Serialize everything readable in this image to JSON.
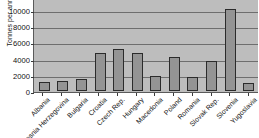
{
  "chart_data": {
    "type": "bar",
    "title": "",
    "xlabel": "",
    "ylabel": "Tonnes per annum",
    "ylim": [
      0,
      11500
    ],
    "grid": true,
    "legend": false,
    "yticks": [
      10000,
      8000,
      6000,
      4000,
      2000,
      0
    ],
    "categories": [
      "Albania",
      "Bosnia Herzegovina",
      "Bulgaria",
      "Croatia",
      "Czech Rep.",
      "Hungary",
      "Macedonia",
      "Poland",
      "Romania",
      "Slovak Rep.",
      "Slovenia",
      "Yugoslavia"
    ],
    "values": [
      1100,
      1200,
      1450,
      4650,
      5200,
      4750,
      1900,
      4200,
      1700,
      3750,
      10200,
      950
    ],
    "colors": {
      "bar_fill": "#949494",
      "bar_border": "#2b2b2b",
      "plot_background": "#bdbdbd",
      "gridline": "#6e6e6e",
      "axis": "#5a5a5a",
      "text": "#111111",
      "page_background": "#ffffff"
    }
  }
}
